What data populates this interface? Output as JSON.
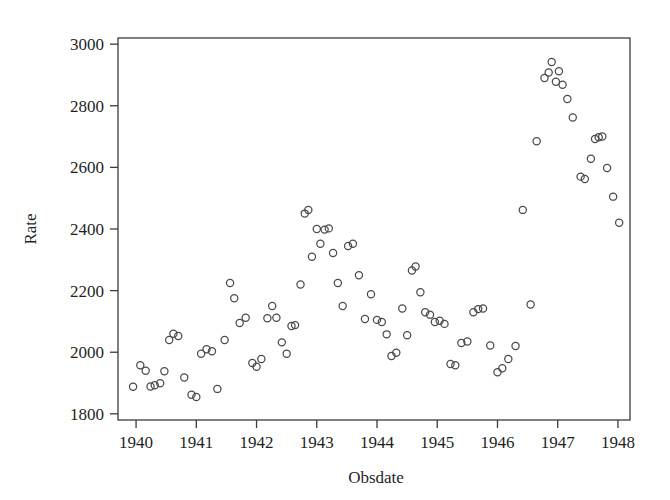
{
  "chart_data": {
    "type": "scatter",
    "title": "",
    "xlabel": "Obsdate",
    "ylabel": "Rate",
    "xlim": [
      1939.7,
      1948.2
    ],
    "ylim": [
      1780,
      3020
    ],
    "grid": false,
    "legend": null,
    "marker": "open-circle",
    "marker_color": "#4a4a4a",
    "xticks": [
      1940,
      1941,
      1942,
      1943,
      1944,
      1945,
      1946,
      1947,
      1948
    ],
    "xticklabels": [
      "1940",
      "1941",
      "1942",
      "1943",
      "1944",
      "1945",
      "1946",
      "1947",
      "1948"
    ],
    "yticks": [
      1800,
      2000,
      2200,
      2400,
      2600,
      2800,
      3000
    ],
    "yticklabels": [
      "1800",
      "2000",
      "2200",
      "2400",
      "2600",
      "2800",
      "3000"
    ],
    "points": [
      {
        "x": 1939.95,
        "y": 1888
      },
      {
        "x": 1940.07,
        "y": 1958
      },
      {
        "x": 1940.16,
        "y": 1940
      },
      {
        "x": 1940.24,
        "y": 1889
      },
      {
        "x": 1940.31,
        "y": 1893
      },
      {
        "x": 1940.4,
        "y": 1899
      },
      {
        "x": 1940.47,
        "y": 1938
      },
      {
        "x": 1940.55,
        "y": 2040
      },
      {
        "x": 1940.62,
        "y": 2060
      },
      {
        "x": 1940.7,
        "y": 2053
      },
      {
        "x": 1940.8,
        "y": 1918
      },
      {
        "x": 1940.92,
        "y": 1862
      },
      {
        "x": 1941.0,
        "y": 1855
      },
      {
        "x": 1941.08,
        "y": 1995
      },
      {
        "x": 1941.17,
        "y": 2010
      },
      {
        "x": 1941.26,
        "y": 2003
      },
      {
        "x": 1941.35,
        "y": 1881
      },
      {
        "x": 1941.47,
        "y": 2040
      },
      {
        "x": 1941.56,
        "y": 2225
      },
      {
        "x": 1941.63,
        "y": 2175
      },
      {
        "x": 1941.72,
        "y": 2095
      },
      {
        "x": 1941.82,
        "y": 2112
      },
      {
        "x": 1941.93,
        "y": 1965
      },
      {
        "x": 1942.0,
        "y": 1953
      },
      {
        "x": 1942.08,
        "y": 1978
      },
      {
        "x": 1942.18,
        "y": 2110
      },
      {
        "x": 1942.26,
        "y": 2150
      },
      {
        "x": 1942.33,
        "y": 2112
      },
      {
        "x": 1942.42,
        "y": 2032
      },
      {
        "x": 1942.5,
        "y": 1995
      },
      {
        "x": 1942.58,
        "y": 2085
      },
      {
        "x": 1942.64,
        "y": 2088
      },
      {
        "x": 1942.73,
        "y": 2220
      },
      {
        "x": 1942.8,
        "y": 2450
      },
      {
        "x": 1942.86,
        "y": 2462
      },
      {
        "x": 1942.92,
        "y": 2310
      },
      {
        "x": 1943.0,
        "y": 2400
      },
      {
        "x": 1943.06,
        "y": 2352
      },
      {
        "x": 1943.13,
        "y": 2398
      },
      {
        "x": 1943.2,
        "y": 2402
      },
      {
        "x": 1943.27,
        "y": 2322
      },
      {
        "x": 1943.35,
        "y": 2225
      },
      {
        "x": 1943.43,
        "y": 2150
      },
      {
        "x": 1943.52,
        "y": 2345
      },
      {
        "x": 1943.6,
        "y": 2352
      },
      {
        "x": 1943.7,
        "y": 2250
      },
      {
        "x": 1943.8,
        "y": 2108
      },
      {
        "x": 1943.9,
        "y": 2188
      },
      {
        "x": 1944.0,
        "y": 2105
      },
      {
        "x": 1944.08,
        "y": 2098
      },
      {
        "x": 1944.16,
        "y": 2058
      },
      {
        "x": 1944.24,
        "y": 1988
      },
      {
        "x": 1944.32,
        "y": 1998
      },
      {
        "x": 1944.42,
        "y": 2142
      },
      {
        "x": 1944.5,
        "y": 2055
      },
      {
        "x": 1944.58,
        "y": 2265
      },
      {
        "x": 1944.64,
        "y": 2278
      },
      {
        "x": 1944.72,
        "y": 2195
      },
      {
        "x": 1944.8,
        "y": 2130
      },
      {
        "x": 1944.88,
        "y": 2122
      },
      {
        "x": 1944.96,
        "y": 2098
      },
      {
        "x": 1945.04,
        "y": 2102
      },
      {
        "x": 1945.12,
        "y": 2092
      },
      {
        "x": 1945.22,
        "y": 1962
      },
      {
        "x": 1945.3,
        "y": 1958
      },
      {
        "x": 1945.4,
        "y": 2030
      },
      {
        "x": 1945.5,
        "y": 2035
      },
      {
        "x": 1945.6,
        "y": 2130
      },
      {
        "x": 1945.68,
        "y": 2140
      },
      {
        "x": 1945.76,
        "y": 2142
      },
      {
        "x": 1945.88,
        "y": 2022
      },
      {
        "x": 1946.0,
        "y": 1935
      },
      {
        "x": 1946.08,
        "y": 1948
      },
      {
        "x": 1946.18,
        "y": 1978
      },
      {
        "x": 1946.3,
        "y": 2020
      },
      {
        "x": 1946.42,
        "y": 2462
      },
      {
        "x": 1946.55,
        "y": 2155
      },
      {
        "x": 1946.65,
        "y": 2685
      },
      {
        "x": 1946.78,
        "y": 2890
      },
      {
        "x": 1946.85,
        "y": 2908
      },
      {
        "x": 1946.9,
        "y": 2942
      },
      {
        "x": 1946.97,
        "y": 2878
      },
      {
        "x": 1947.02,
        "y": 2912
      },
      {
        "x": 1947.08,
        "y": 2868
      },
      {
        "x": 1947.16,
        "y": 2822
      },
      {
        "x": 1947.25,
        "y": 2762
      },
      {
        "x": 1947.38,
        "y": 2570
      },
      {
        "x": 1947.45,
        "y": 2562
      },
      {
        "x": 1947.55,
        "y": 2628
      },
      {
        "x": 1947.62,
        "y": 2692
      },
      {
        "x": 1947.68,
        "y": 2698
      },
      {
        "x": 1947.74,
        "y": 2700
      },
      {
        "x": 1947.82,
        "y": 2598
      },
      {
        "x": 1947.92,
        "y": 2505
      },
      {
        "x": 1948.02,
        "y": 2420
      }
    ]
  }
}
